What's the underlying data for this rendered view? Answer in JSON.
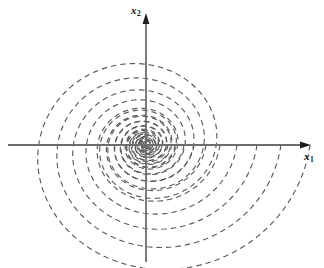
{
  "figure": {
    "kind": "phase-portrait",
    "background_color": "#ffffff",
    "width": 324,
    "height": 268
  },
  "axes": {
    "origin": {
      "x": 146,
      "y": 145
    },
    "color": "#6e6e6e",
    "stroke_width": 1.8,
    "horizontal": {
      "name": "x1",
      "label_text": "x",
      "label_sub": "1",
      "x_start": 8,
      "x_end": 311,
      "arrow": "right"
    },
    "vertical": {
      "name": "x2",
      "label_text": "x",
      "label_sub": "2",
      "y_start": 262,
      "y_end": 13,
      "arrow": "up"
    }
  },
  "curves": {
    "color": "#5a5a5a",
    "stroke_width": 1.15,
    "dash_pattern": "5.5 4",
    "style": "dashed"
  },
  "chart_data": {
    "type": "line",
    "title": "",
    "xlabel": "x1",
    "ylabel": "x2",
    "equilibrium": {
      "x": 0,
      "y": 0,
      "classification": "stable spiral / focus"
    },
    "spiral": {
      "direction": "clockwise-inward",
      "decay_rate_b": 0.135,
      "aspect_y": 0.93,
      "theta_start_deg": 0,
      "theta_end_deg": 1000
    },
    "series": [
      {
        "name": "trajectory-1",
        "r0": 11,
        "phase_deg": 0
      },
      {
        "name": "trajectory-2",
        "r0": 16,
        "phase_deg": 0
      },
      {
        "name": "trajectory-3",
        "r0": 22,
        "phase_deg": 0
      },
      {
        "name": "trajectory-4",
        "r0": 29,
        "phase_deg": 0
      },
      {
        "name": "trajectory-5",
        "r0": 38,
        "phase_deg": 0
      },
      {
        "name": "trajectory-6",
        "r0": 48,
        "phase_deg": 0
      },
      {
        "name": "trajectory-7",
        "r0": 60,
        "phase_deg": 0
      },
      {
        "name": "trajectory-8",
        "r0": 74,
        "phase_deg": 0
      },
      {
        "name": "trajectory-9",
        "r0": 91,
        "phase_deg": 0
      },
      {
        "name": "trajectory-10",
        "r0": 111,
        "phase_deg": 0
      },
      {
        "name": "trajectory-11",
        "r0": 135,
        "phase_deg": 0
      },
      {
        "name": "trajectory-12",
        "r0": 164,
        "phase_deg": 0
      }
    ],
    "axis_crossings_positive_x": [
      12,
      17,
      23,
      31,
      40,
      51,
      64,
      79,
      97,
      118,
      142,
      168
    ],
    "axis_crossings_negative_x": [
      -10,
      -14,
      -20,
      -27,
      -35,
      -45,
      -57,
      -72,
      -90,
      -112
    ],
    "grid": false,
    "legend": false
  }
}
